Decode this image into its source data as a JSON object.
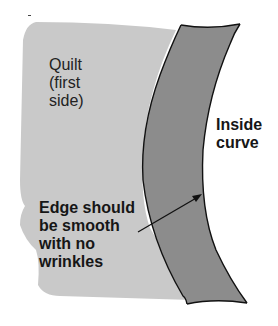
{
  "diagram": {
    "labels": {
      "quilt": [
        "Quilt",
        "(first",
        "side)"
      ],
      "inside_curve": [
        "Inside",
        "curve"
      ],
      "edge_note": [
        "Edge should",
        "be smooth",
        "with no",
        "wrinkles"
      ]
    },
    "colors": {
      "quilt_fill": "#c9c9c9",
      "binding_fill": "#8c8c8c",
      "outline": "#111111",
      "text": "#161616",
      "background": "#ffffff"
    },
    "elements": [
      {
        "name": "quilt-first-side",
        "shape": "light grey region"
      },
      {
        "name": "binding-strip",
        "shape": "dark grey curved band"
      },
      {
        "name": "pointer-arrow",
        "from_label": "Edge should be smooth with no wrinkles",
        "points_to": "inside edge of binding strip"
      }
    ]
  }
}
